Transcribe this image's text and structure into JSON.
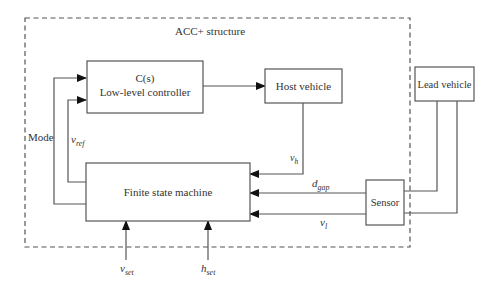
{
  "diagram": {
    "group_title": "ACC+ structure",
    "blocks": {
      "controller": {
        "line1": "C(s)",
        "line2": "Low-level controller"
      },
      "host_vehicle": {
        "label": "Host vehicle"
      },
      "lead_vehicle": {
        "label": "Lead vehicle"
      },
      "fsm": {
        "label": "Finite state machine"
      },
      "sensor": {
        "label": "Sensor"
      }
    },
    "signals": {
      "mode": {
        "label": "Mode"
      },
      "v_ref": {
        "base": "v",
        "sub": "ref"
      },
      "v_h": {
        "base": "v",
        "sub": "h"
      },
      "d_gap": {
        "base": "d",
        "sub": "gap"
      },
      "v_l": {
        "base": "v",
        "sub": "l"
      },
      "v_set": {
        "base": "v",
        "sub": "set"
      },
      "h_set": {
        "base": "h",
        "sub": "set"
      }
    },
    "edges": [
      {
        "from": "fsm",
        "to": "controller",
        "signal": "mode"
      },
      {
        "from": "fsm",
        "to": "controller",
        "signal": "v_ref"
      },
      {
        "from": "controller",
        "to": "host_vehicle"
      },
      {
        "from": "host_vehicle",
        "to": "fsm",
        "signal": "v_h"
      },
      {
        "from": "sensor",
        "to": "fsm",
        "signal": "d_gap"
      },
      {
        "from": "sensor",
        "to": "fsm",
        "signal": "v_l"
      },
      {
        "from": "lead_vehicle",
        "to": "sensor"
      },
      {
        "from": "lead_vehicle",
        "to": "sensor"
      },
      {
        "from": "input",
        "to": "fsm",
        "signal": "v_set"
      },
      {
        "from": "input",
        "to": "fsm",
        "signal": "h_set"
      }
    ]
  }
}
